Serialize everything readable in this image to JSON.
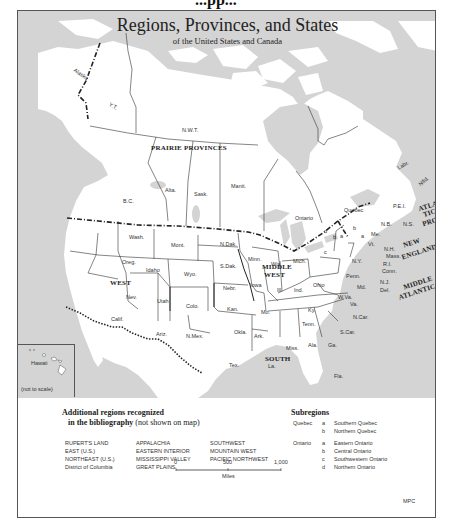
{
  "page": {
    "top_cut_text": "...pp..."
  },
  "map": {
    "title": "Regions, Provinces, and States",
    "subtitle": "of the United States and Canada",
    "colors": {
      "water": "#d4d4d4",
      "land": "#ffffff",
      "border": "#333333"
    },
    "region_labels": {
      "prairie": "PRAIRIE PROVINCES",
      "west": "WEST",
      "midwest_1": "MIDDLE",
      "midwest_2": "WEST",
      "south": "SOUTH",
      "new_england_1": "NEW",
      "new_england_2": "ENGLAND",
      "middle_atlantic_1": "MIDDLE",
      "middle_atlantic_2": "ATLANTIC",
      "atlantic_1": "ATLAN-",
      "atlantic_2": "TIC",
      "atlantic_3": "PROV."
    },
    "place_labels": {
      "alaska": "Alaska",
      "yt": "Y.T.",
      "nwt": "N.W.T.",
      "bc": "B.C.",
      "alta": "Alta.",
      "sask": "Sask.",
      "manit": "Manit.",
      "ontario": "Ontario",
      "quebec": "Quebec",
      "labr": "Labr.",
      "nfld": "Nfld.",
      "pei": "P.E.I.",
      "nb": "N.B.",
      "ns": "N.S.",
      "me": "Me.",
      "nh": "N.H.",
      "vt": "Vt.",
      "mass": "Mass.",
      "ri": "R.I.",
      "conn": "Conn.",
      "ny": "N.Y.",
      "nj": "N.J.",
      "del": "Del.",
      "md": "Md.",
      "penn": "Penn.",
      "wva": "W.Va.",
      "va": "Va.",
      "ncar": "N.Car.",
      "scar": "S.Car.",
      "ga": "Ga.",
      "fla": "Fla.",
      "ala": "Ala.",
      "miss": "Miss.",
      "tenn": "Tenn.",
      "ky": "Ky.",
      "ohio": "Ohio",
      "ind": "Ind.",
      "ill": "Ill.",
      "mich": "Mich.",
      "wis": "Wis.",
      "minn": "Minn.",
      "iowa": "Iowa",
      "mo": "Mo.",
      "ark": "Ark.",
      "la": "La.",
      "tex": "Tex.",
      "okla": "Okla.",
      "kan": "Kan.",
      "nebr": "Nebr.",
      "sdak": "S.Dak.",
      "ndak": "N.Dak.",
      "mont": "Mont.",
      "wyo": "Wyo.",
      "colo": "Colo.",
      "nmex": "N.Mex.",
      "ariz": "Ariz.",
      "utah": "Utah",
      "nev": "Nev.",
      "calif": "Calif.",
      "idaho": "Idaho",
      "oreg": "Oreg.",
      "wash": "Wash.",
      "hawaii": "Hawaii",
      "not_to_scale": "(not to scale)",
      "sub_a": "a",
      "sub_b": "b",
      "sub_c": "c",
      "sub_d": "d"
    }
  },
  "legend": {
    "heading_line1": "Additional regions recognized",
    "heading_line2": "in the bibliography",
    "heading_note": "(not shown on map)",
    "columns": [
      [
        "RUPERT'S LAND",
        "EAST (U.S.)",
        "NORTHEAST (U.S.)",
        "District of Columbia"
      ],
      [
        "APPALACHIA",
        "EASTERN INTERIOR",
        "MISSISSIPPI VALLEY",
        "GREAT PLAINS"
      ],
      [
        "SOUTHWEST",
        "MOUNTAIN WEST",
        "PACIFIC NORTHWEST"
      ]
    ]
  },
  "subregions": {
    "heading": "Subregions",
    "groups": [
      {
        "province": "Quebec",
        "items": [
          {
            "key": "a",
            "name": "Southern Quebec"
          },
          {
            "key": "b",
            "name": "Northern Quebec"
          }
        ]
      },
      {
        "province": "Ontario",
        "items": [
          {
            "key": "a",
            "name": "Eastern Ontario"
          },
          {
            "key": "b",
            "name": "Central Ontario"
          },
          {
            "key": "c",
            "name": "Southwestern Ontario"
          },
          {
            "key": "d",
            "name": "Northern Ontario"
          }
        ]
      }
    ]
  },
  "scale_bar": {
    "ticks": [
      "0",
      "500",
      "1,000"
    ],
    "unit": "Miles"
  },
  "credit": "MPC"
}
